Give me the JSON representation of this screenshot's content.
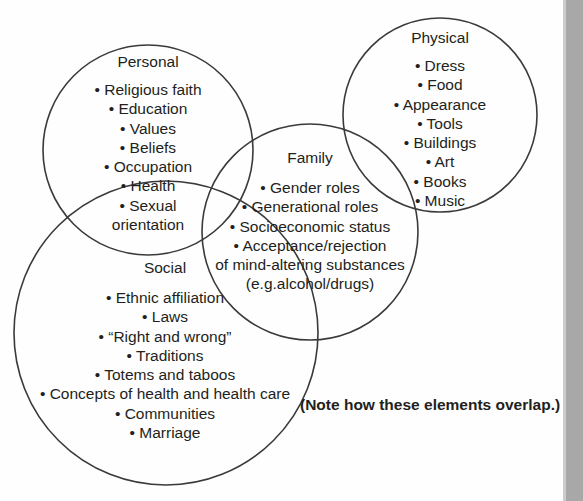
{
  "diagram": {
    "type": "venn",
    "title": "",
    "background_color": "#fefefe",
    "stroke_color": "#3a3a3a",
    "text_color": "#231f20",
    "accent_bar_color": "#a8a8a8",
    "circles": [
      {
        "key": "personal",
        "label": "Personal",
        "cx": 148,
        "cy": 150,
        "r": 105,
        "items": [
          "• Religious faith",
          "• Education",
          "• Values",
          "• Beliefs",
          "• Occupation",
          "• Health",
          "• Sexual",
          "orientation"
        ]
      },
      {
        "key": "physical",
        "label": "Physical",
        "cx": 440,
        "cy": 115,
        "r": 97,
        "items": [
          "• Dress",
          "• Food",
          "• Appearance",
          "• Tools",
          "• Buildings",
          "• Art",
          "• Books",
          "• Music"
        ]
      },
      {
        "key": "family",
        "label": "Family",
        "cx": 310,
        "cy": 232,
        "r": 108,
        "items": [
          "• Gender roles",
          "• Generational roles",
          "• Socioeconomic status",
          "• Acceptance/rejection",
          "of mind-altering substances",
          "(e.g.alcohol/drugs)"
        ]
      },
      {
        "key": "social",
        "label": "Social",
        "cx": 166,
        "cy": 333,
        "r": 152,
        "items": [
          "• Ethnic affiliation",
          "• Laws",
          "• “Right and wrong”",
          "• Traditions",
          "• Totems and taboos",
          "• Concepts of health and health care",
          "• Communities",
          "• Marriage"
        ]
      }
    ],
    "note": "(Note how these elements overlap.)"
  }
}
